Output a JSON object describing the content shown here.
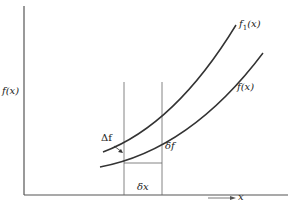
{
  "diagram": {
    "y_axis_label": "f(x)",
    "x_axis_label": "x",
    "curves": [
      {
        "name": "f1",
        "label_main": "f",
        "label_sub": "1",
        "label_arg": "(x)"
      },
      {
        "name": "f",
        "label": "f(x)"
      }
    ],
    "annotations": {
      "big_delta_f": "Δf",
      "small_delta_f": "δf",
      "small_delta_x": "δx"
    },
    "colors": {
      "line": "#333333",
      "background": "#ffffff"
    }
  }
}
